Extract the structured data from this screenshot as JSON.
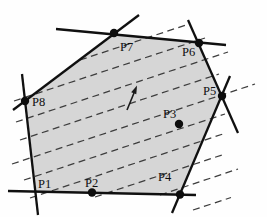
{
  "figure": {
    "width": 267,
    "height": 217,
    "background": "#fefefe",
    "polygon": {
      "fill": "#d6d6d6",
      "points": [
        [
          35,
          191.5
        ],
        [
          25,
          101
        ],
        [
          114,
          34
        ],
        [
          199,
          43
        ],
        [
          222,
          96
        ],
        [
          180,
          194.5
        ]
      ]
    },
    "edge_lines": {
      "color": "#101010",
      "stroke_width": 2.3,
      "segments": [
        {
          "name": "edge-bottom-line",
          "x1": 8,
          "y1": 191,
          "x2": 196,
          "y2": 195
        },
        {
          "name": "edge-left-line",
          "x1": 22,
          "y1": 74,
          "x2": 38,
          "y2": 215
        },
        {
          "name": "edge-p8-p7-line",
          "x1": 13,
          "y1": 110,
          "x2": 139,
          "y2": 15
        },
        {
          "name": "edge-p7-p6-line",
          "x1": 56,
          "y1": 29,
          "x2": 226,
          "y2": 45
        },
        {
          "name": "edge-p6-p5-line",
          "x1": 188,
          "y1": 20,
          "x2": 238,
          "y2": 133
        },
        {
          "name": "edge-p5-p4-line",
          "x1": 230,
          "y1": 76,
          "x2": 172,
          "y2": 213
        }
      ]
    },
    "dashed_lines": {
      "color": "#3d3d3d",
      "stroke_width": 1.25,
      "dash_pattern": "7 4.5",
      "segments": [
        [
          80,
          60,
          189,
          24
        ],
        [
          14,
          101,
          205,
          38
        ],
        [
          16,
          122,
          228,
          52
        ],
        [
          20,
          140,
          219,
          74
        ],
        [
          12,
          164,
          255,
          84
        ],
        [
          24,
          180,
          225,
          114
        ],
        [
          30,
          198,
          223,
          134
        ],
        [
          95,
          197,
          222,
          155
        ],
        [
          160,
          195,
          238,
          169
        ],
        [
          193,
          210,
          231,
          197.5
        ]
      ]
    },
    "points": [
      {
        "label": "P1",
        "dot": false,
        "label_x": 38,
        "label_y": 188
      },
      {
        "label": "P2",
        "dot": true,
        "x": 92,
        "y": 192.5,
        "label_x": 85,
        "label_y": 187
      },
      {
        "label": "P3",
        "dot": true,
        "x": 179,
        "y": 124,
        "label_x": 163,
        "label_y": 118
      },
      {
        "label": "P4",
        "dot": true,
        "x": 180,
        "y": 194.5,
        "label_x": 158,
        "label_y": 181
      },
      {
        "label": "P5",
        "dot": true,
        "x": 222,
        "y": 96,
        "label_x": 203,
        "label_y": 95
      },
      {
        "label": "P6",
        "dot": true,
        "x": 199,
        "y": 43,
        "label_x": 182,
        "label_y": 56
      },
      {
        "label": "P7",
        "dot": true,
        "x": 114,
        "y": 33,
        "label_x": 120,
        "label_y": 51
      },
      {
        "label": "P8",
        "dot": true,
        "x": 25,
        "y": 101,
        "label_x": 32,
        "label_y": 106
      }
    ],
    "dot_radius": 4.2,
    "dot_color": "#0d0d0d",
    "arrow": {
      "color": "#1a1a1a",
      "stroke_width": 1.6,
      "shaft": {
        "x1": 127,
        "y1": 110,
        "x2": 134,
        "y2": 93
      },
      "head_points": [
        [
          137,
          85.5
        ],
        [
          136.3,
          94.3
        ],
        [
          131.2,
          92.2
        ]
      ]
    }
  }
}
